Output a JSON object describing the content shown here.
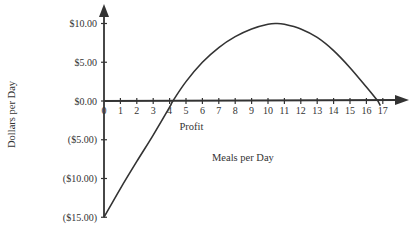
{
  "chart_data": {
    "type": "line",
    "title": "",
    "xlabel": "Meals per Day",
    "ylabel": "Dollars per Day",
    "xlim": [
      0,
      17
    ],
    "ylim": [
      -15,
      10
    ],
    "x_ticks": [
      "0",
      "1",
      "2",
      "3",
      "4",
      "5",
      "6",
      "7",
      "8",
      "9",
      "10",
      "11",
      "12",
      "13",
      "14",
      "15",
      "16",
      "17"
    ],
    "y_ticks": [
      "$10.00",
      "$5.00",
      "$0.00",
      "($5.00)",
      "($10.00)",
      "($15.00)"
    ],
    "y_tick_values": [
      10,
      5,
      0,
      -5,
      -10,
      -15
    ],
    "grid": false,
    "legend": null,
    "annotations": [
      {
        "text": "Profit",
        "x": 4.6,
        "y": -2.5
      }
    ],
    "series": [
      {
        "name": "Profit",
        "x": [
          0,
          1,
          2,
          3,
          4,
          4.2,
          5,
          6,
          7,
          8,
          9,
          10,
          10.5,
          11,
          12,
          13,
          14,
          15,
          16,
          16.7
        ],
        "values": [
          -15,
          -11.3,
          -7.8,
          -4.4,
          -0.8,
          0,
          2.5,
          5.0,
          6.9,
          8.3,
          9.3,
          9.9,
          10.0,
          9.9,
          9.3,
          8.2,
          6.5,
          4.3,
          1.8,
          0
        ]
      }
    ]
  }
}
